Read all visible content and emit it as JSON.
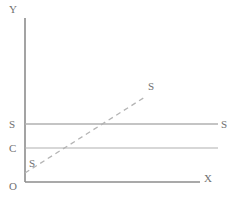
{
  "figure": {
    "title": "",
    "width": 237,
    "height": 202,
    "background": "#ffffff"
  },
  "axes": {
    "y_label": "Y",
    "x_label": "X",
    "origin_label": "O",
    "axis_color": "#8c8c8c",
    "y_axis": {
      "x": 25,
      "y_top": 18,
      "y_bottom": 182
    },
    "x_axis": {
      "y": 182,
      "x_left": 25,
      "x_right": 200
    }
  },
  "lines": [
    {
      "id": "s-horizontal",
      "left_label": "S",
      "right_label": "S",
      "style": "solid",
      "color": "#b0b0b0",
      "y": 124,
      "x_start": 25,
      "x_end": 218
    },
    {
      "id": "c-horizontal",
      "left_label": "C",
      "right_label": "",
      "style": "solid",
      "color": "#b0b0b0",
      "y": 148,
      "x_start": 25,
      "x_end": 218
    }
  ],
  "curve": {
    "id": "s-rising",
    "start_label": "S",
    "end_label": "S",
    "style": "dashed",
    "color": "#b4b4b4",
    "dash_pattern": "5 4",
    "x_start": 25,
    "y_start": 173,
    "x_end": 145,
    "y_end": 97
  },
  "chart_data": {
    "type": "line",
    "title": "",
    "xlabel": "X",
    "ylabel": "Y",
    "origin": "O",
    "grid": false,
    "legend": "none",
    "series": [
      {
        "name": "S",
        "style": "solid",
        "orientation": "horizontal",
        "label_left": "S",
        "label_right": "S",
        "x": [
          0,
          1
        ],
        "y": [
          0.353,
          0.353
        ]
      },
      {
        "name": "C",
        "style": "solid",
        "orientation": "horizontal",
        "label_left": "C",
        "label_right": "",
        "x": [
          0,
          1
        ],
        "y": [
          0.207,
          0.207
        ]
      },
      {
        "name": "S-rising",
        "style": "dashed",
        "orientation": "upward-sloping",
        "label_start": "S",
        "label_end": "S",
        "x": [
          0,
          0.686
        ],
        "y": [
          0.055,
          0.518
        ]
      }
    ],
    "xlim": [
      0,
      1
    ],
    "ylim": [
      0,
      1
    ]
  }
}
